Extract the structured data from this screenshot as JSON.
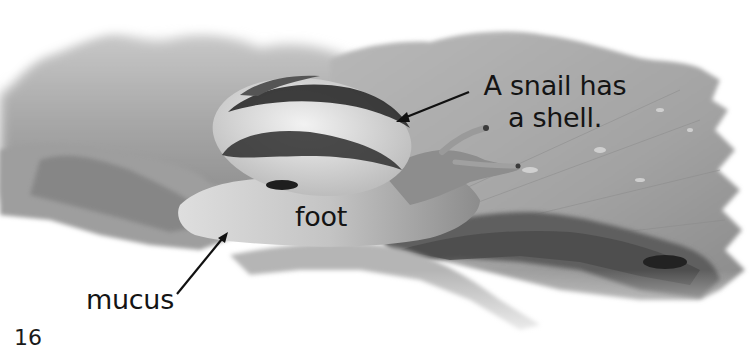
{
  "page": {
    "number": "16",
    "photo": {
      "subject": "snail on a leaf",
      "style": "grayscale"
    },
    "labels": {
      "shell_line1": "A snail has",
      "shell_line2": "a shell.",
      "foot": "foot",
      "mucus": "mucus"
    },
    "colors": {
      "text": "#141414",
      "background": "#ffffff"
    }
  }
}
